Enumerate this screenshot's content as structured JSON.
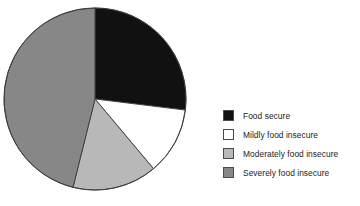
{
  "chart_data": {
    "type": "pie",
    "title": "",
    "subtitle": "",
    "xlabel": "",
    "ylabel": "",
    "grid": false,
    "legend_position": "right",
    "start_angle_deg": 0,
    "direction": "clockwise",
    "categories": [
      "Food secure",
      "Mildly food insecure",
      "Moderately food insecure",
      "Severely food insecure"
    ],
    "values": [
      27,
      12,
      15,
      46
    ],
    "value_unit": "percent",
    "slices": [
      {
        "label": "Food secure",
        "value": 27,
        "color": "#111111",
        "start_angle_deg": 0,
        "end_angle_deg": 97
      },
      {
        "label": "Mildly food insecure",
        "value": 12,
        "color": "#ffffff",
        "start_angle_deg": 97,
        "end_angle_deg": 140
      },
      {
        "label": "Moderately food insecure",
        "value": 15,
        "color": "#b8b8b8",
        "start_angle_deg": 140,
        "end_angle_deg": 194
      },
      {
        "label": "Severely food insecure",
        "value": 46,
        "color": "#878787",
        "start_angle_deg": 194,
        "end_angle_deg": 360
      }
    ],
    "legend": [
      {
        "label": "Food secure",
        "color": "#111111"
      },
      {
        "label": "Mildly food insecure",
        "color": "#ffffff"
      },
      {
        "label": "Moderately food insecure",
        "color": "#b8b8b8"
      },
      {
        "label": "Severely food insecure",
        "color": "#878787"
      }
    ],
    "geometry": {
      "center_x": 95,
      "center_y": 99,
      "radius": 91,
      "outline_color": "#3a3a3a"
    }
  }
}
